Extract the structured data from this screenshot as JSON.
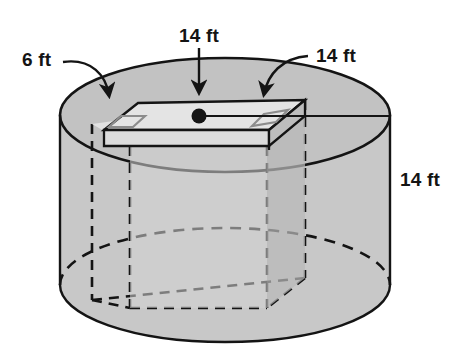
{
  "figure": {
    "kind": "geometry-diagram",
    "background_color": "#ffffff",
    "stroke_color": "#141414",
    "solids": [
      {
        "name": "cylinder",
        "fill_color": "#c9c9c9",
        "top_face_fill": "#c2c2c2",
        "labels": [
          "14 ft"
        ]
      },
      {
        "name": "rectangular-prism",
        "fill_color": "#d8d8d8",
        "top_face_fill": "#e0e0e0",
        "hidden_edge_style": "dashed",
        "labels": [
          "6 ft",
          "14 ft",
          "14 ft"
        ]
      }
    ],
    "callouts": [
      {
        "id": "depth",
        "text": "6 ft",
        "leader": "curved-arrow",
        "position": "top-left",
        "points_to": "prism-top-left-corner"
      },
      {
        "id": "diameter",
        "text": "14 ft",
        "leader": "straight-arrow",
        "position": "top-center",
        "points_to": "prism-top-center-point"
      },
      {
        "id": "width",
        "text": "14 ft",
        "leader": "curved-line",
        "position": "top-right",
        "points_to": "prism-top-right-corner"
      },
      {
        "id": "height",
        "text": "14 ft",
        "leader": "none",
        "position": "right",
        "points_to": "cylinder-side-height"
      }
    ],
    "markers": {
      "right_angle_count": 2,
      "center_dot": true
    }
  }
}
